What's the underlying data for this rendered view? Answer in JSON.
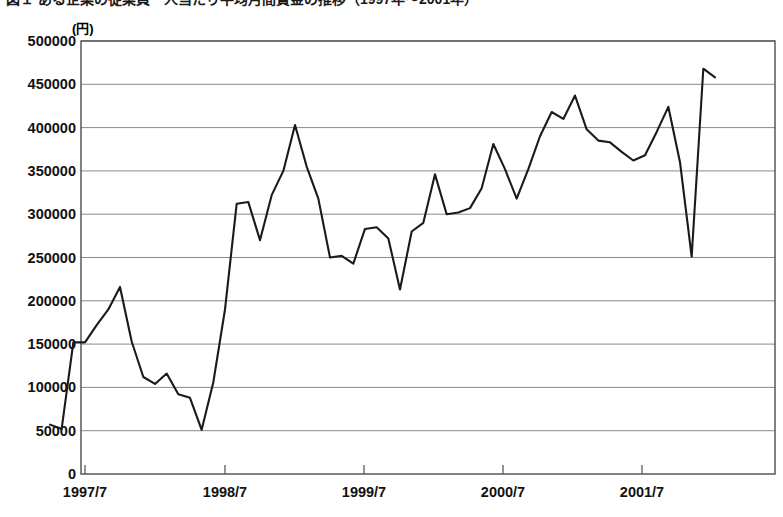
{
  "figure": {
    "title_clipped": "図１ ある企業の従業員一人当たり平均月間賃金の推移（1997年〜2001年）",
    "unit_label": "(円)",
    "background_color": "#ffffff",
    "line_color": "#1a1a1a",
    "grid_color": "#8a8a8a",
    "frame_color": "#4d4d4d"
  },
  "chart_data": {
    "type": "line",
    "title": "図１ ある企業の従業員一人当たり平均月間賃金の推移（1997年〜2001年）",
    "xlabel": "",
    "ylabel": "(円)",
    "ylim": [
      0,
      500000
    ],
    "ytick_labels": [
      "0",
      "50000",
      "100000",
      "150000",
      "200000",
      "250000",
      "300000",
      "350000",
      "400000",
      "450000",
      "500000"
    ],
    "ytick_values": [
      0,
      50000,
      100000,
      150000,
      200000,
      250000,
      300000,
      350000,
      400000,
      450000,
      500000
    ],
    "xtick_labels": [
      "1997/7",
      "1998/7",
      "1999/7",
      "2000/7",
      "2001/7"
    ],
    "xtick_values": [
      "1997-07",
      "1998-07",
      "1999-07",
      "2000-07",
      "2001-07"
    ],
    "grid": true,
    "grid_axis": "y",
    "legend": false,
    "legend_position": "none",
    "series": [
      {
        "name": "月間賃金",
        "x": [
          "1997-04",
          "1997-05",
          "1997-06",
          "1997-07",
          "1997-08",
          "1997-09",
          "1997-10",
          "1997-11",
          "1997-12",
          "1998-01",
          "1998-02",
          "1998-03",
          "1998-04",
          "1998-05",
          "1998-06",
          "1998-07",
          "1998-08",
          "1998-09",
          "1998-10",
          "1998-11",
          "1998-12",
          "1999-01",
          "1999-02",
          "1999-03",
          "1999-04",
          "1999-05",
          "1999-06",
          "1999-07",
          "1999-08",
          "1999-09",
          "1999-10",
          "1999-11",
          "1999-12",
          "2000-01",
          "2000-02",
          "2000-03",
          "2000-04",
          "2000-05",
          "2000-06",
          "2000-07",
          "2000-08",
          "2000-09",
          "2000-10",
          "2000-11",
          "2000-12",
          "2001-01",
          "2001-02",
          "2001-03",
          "2001-04",
          "2001-05",
          "2001-06",
          "2001-07",
          "2001-08",
          "2001-09",
          "2001-10",
          "2001-11",
          "2001-12",
          "2002-01"
        ],
        "values": [
          57000,
          52000,
          152000,
          152000,
          172000,
          190000,
          216000,
          153000,
          112000,
          104000,
          116000,
          92000,
          88000,
          51000,
          106000,
          190000,
          312000,
          314000,
          270000,
          322000,
          350000,
          403000,
          355000,
          318000,
          250000,
          252000,
          243000,
          283000,
          285000,
          272000,
          213000,
          280000,
          290000,
          346000,
          300000,
          302000,
          307000,
          330000,
          381000,
          352000,
          318000,
          352000,
          390000,
          418000,
          410000,
          437000,
          398000,
          385000,
          383000,
          372000,
          362000,
          368000,
          395000,
          424000,
          360000,
          251000,
          468000,
          458000
        ]
      }
    ]
  },
  "axes_geometry": {
    "plot_left_px": 81,
    "plot_right_px": 775,
    "plot_top_px": 41,
    "plot_bottom_px": 474,
    "x_tick_px": [
      85,
      225,
      364,
      503,
      642
    ],
    "months_per_tick": 12,
    "px_per_month": 11.6
  }
}
